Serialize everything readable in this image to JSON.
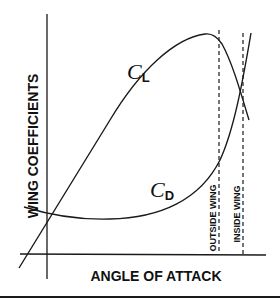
{
  "diagram": {
    "y_axis_label": "WING COEFFICIENTS",
    "x_axis_label": "ANGLE OF ATTACK",
    "curves": [
      {
        "name": "lift-coefficient",
        "symbol": "C",
        "subscript": "L"
      },
      {
        "name": "drag-coefficient",
        "symbol": "C",
        "subscript": "D"
      }
    ],
    "markers": [
      {
        "name": "outside-wing",
        "label": "OUTSIDE WING"
      },
      {
        "name": "inside-wing",
        "label": "INSIDE WING"
      }
    ],
    "colors": {
      "ink": "#1a1a1a",
      "background": "#ffffff"
    }
  }
}
